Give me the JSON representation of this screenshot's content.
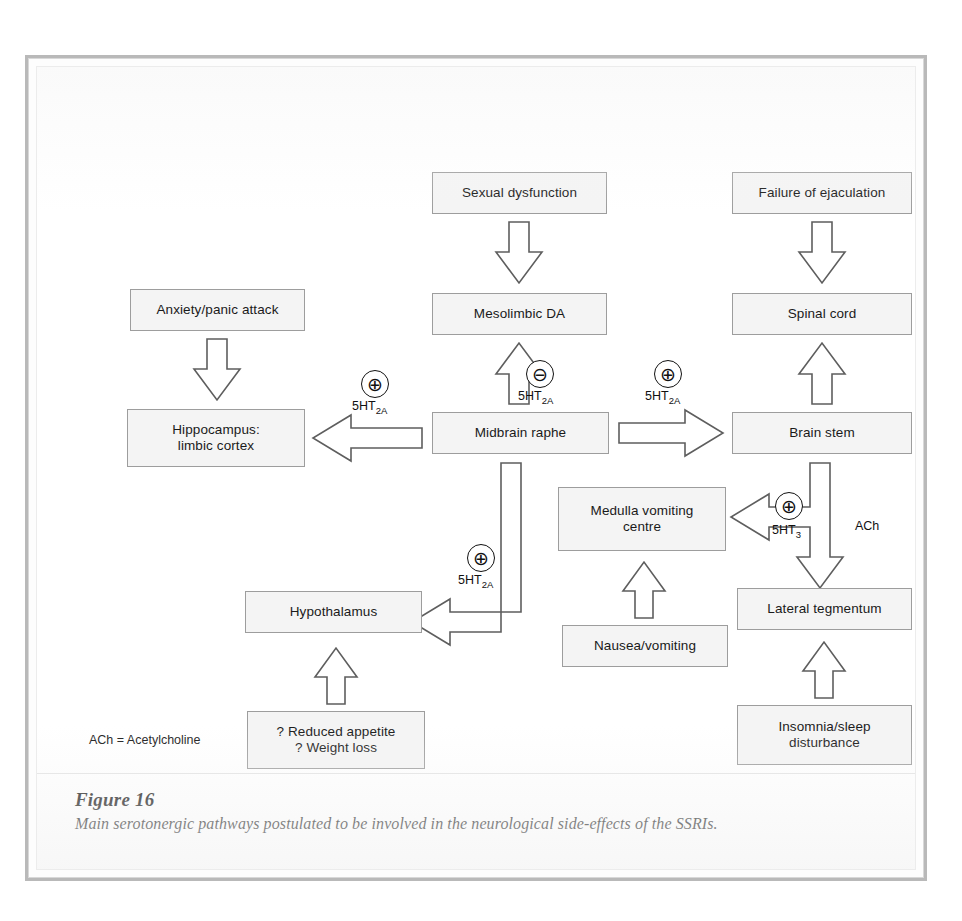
{
  "figure": {
    "number": "Figure 16",
    "caption": "Main serotonergic pathways postulated to be involved in the neurological side-effects of the SSRIs.",
    "legend": "ACh = Acetylcholine"
  },
  "diagram": {
    "type": "flowchart",
    "nodes": [
      {
        "id": "sexual-dysfunction",
        "label": "Sexual dysfunction",
        "x": 395,
        "y": 105,
        "w": 175,
        "h": 42
      },
      {
        "id": "failure-ejaculation",
        "label": "Failure of ejaculation",
        "x": 695,
        "y": 105,
        "w": 180,
        "h": 42
      },
      {
        "id": "anxiety-panic",
        "label": "Anxiety/panic attack",
        "x": 93,
        "y": 222,
        "w": 175,
        "h": 42
      },
      {
        "id": "mesolimbic-da",
        "label": "Mesolimbic DA",
        "x": 395,
        "y": 226,
        "w": 175,
        "h": 42
      },
      {
        "id": "spinal-cord",
        "label": "Spinal cord",
        "x": 695,
        "y": 226,
        "w": 180,
        "h": 42
      },
      {
        "id": "hippocampus",
        "label": "Hippocampus:\nlimbic cortex",
        "x": 90,
        "y": 342,
        "w": 178,
        "h": 58
      },
      {
        "id": "midbrain-raphe",
        "label": "Midbrain raphe",
        "x": 395,
        "y": 345,
        "w": 177,
        "h": 42
      },
      {
        "id": "brain-stem",
        "label": "Brain stem",
        "x": 695,
        "y": 345,
        "w": 180,
        "h": 42
      },
      {
        "id": "medulla-vomiting",
        "label": "Medulla vomiting\ncentre",
        "x": 521,
        "y": 420,
        "w": 168,
        "h": 64
      },
      {
        "id": "lateral-tegmentum",
        "label": "Lateral tegmentum",
        "x": 700,
        "y": 521,
        "w": 175,
        "h": 42
      },
      {
        "id": "hypothalamus",
        "label": "Hypothalamus",
        "x": 208,
        "y": 524,
        "w": 177,
        "h": 42
      },
      {
        "id": "nausea-vomiting",
        "label": "Nausea/vomiting",
        "x": 525,
        "y": 558,
        "w": 166,
        "h": 42
      },
      {
        "id": "reduced-appetite",
        "label": "? Reduced appetite\n? Weight loss",
        "x": 210,
        "y": 644,
        "w": 178,
        "h": 58
      },
      {
        "id": "insomnia-sleep",
        "label": "Insomnia/sleep\ndisturbance",
        "x": 700,
        "y": 638,
        "w": 175,
        "h": 60
      }
    ],
    "edges": [
      {
        "id": "e-sexdys-mesolimbic",
        "from": "sexual-dysfunction",
        "to": "mesolimbic-da",
        "direction": "down",
        "sign": "",
        "receptor": ""
      },
      {
        "id": "e-failej-spinal",
        "from": "failure-ejaculation",
        "to": "spinal-cord",
        "direction": "down",
        "sign": "",
        "receptor": ""
      },
      {
        "id": "e-anxiety-hippocampus",
        "from": "anxiety-panic",
        "to": "hippocampus",
        "direction": "down",
        "sign": "",
        "receptor": ""
      },
      {
        "id": "e-raphe-hippocampus",
        "from": "midbrain-raphe",
        "to": "hippocampus",
        "direction": "left",
        "sign": "plus",
        "receptor": "5HT2A"
      },
      {
        "id": "e-raphe-mesolimbic",
        "from": "midbrain-raphe",
        "to": "mesolimbic-da",
        "direction": "up",
        "sign": "minus",
        "receptor": "5HT2A"
      },
      {
        "id": "e-raphe-brainstem",
        "from": "midbrain-raphe",
        "to": "brain-stem",
        "direction": "right",
        "sign": "plus",
        "receptor": "5HT2A"
      },
      {
        "id": "e-brainstem-spinal",
        "from": "brain-stem",
        "to": "spinal-cord",
        "direction": "up",
        "sign": "",
        "receptor": ""
      },
      {
        "id": "e-brainstem-medulla",
        "from": "brain-stem",
        "to": "medulla-vomiting",
        "direction": "left",
        "sign": "plus",
        "receptor": "5HT3"
      },
      {
        "id": "e-brainstem-tegmentum",
        "from": "brain-stem",
        "to": "lateral-tegmentum",
        "direction": "down",
        "sign": "",
        "receptor": "ACh"
      },
      {
        "id": "e-raphe-hypothalamus",
        "from": "midbrain-raphe",
        "to": "hypothalamus",
        "direction": "left",
        "sign": "plus",
        "receptor": "5HT2A"
      },
      {
        "id": "e-nausea-medulla",
        "from": "nausea-vomiting",
        "to": "medulla-vomiting",
        "direction": "up",
        "sign": "",
        "receptor": ""
      },
      {
        "id": "e-appetite-hypothal",
        "from": "reduced-appetite",
        "to": "hypothalamus",
        "direction": "up",
        "sign": "",
        "receptor": ""
      },
      {
        "id": "e-insomnia-tegmentum",
        "from": "insomnia-sleep",
        "to": "lateral-tegmentum",
        "direction": "up",
        "sign": "",
        "receptor": ""
      }
    ],
    "badges": [
      {
        "id": "badge-raphe-hippocampus",
        "sign": "⊕",
        "name": "plus-sign-icon",
        "x": 324,
        "y": 303
      },
      {
        "id": "badge-raphe-mesolimbic",
        "sign": "⊖",
        "name": "minus-sign-icon",
        "x": 489,
        "y": 293
      },
      {
        "id": "badge-raphe-brainstem",
        "sign": "⊕",
        "name": "plus-sign-icon",
        "x": 617,
        "y": 293
      },
      {
        "id": "badge-brainstem-medulla",
        "sign": "⊕",
        "name": "plus-sign-icon",
        "x": 738,
        "y": 425
      },
      {
        "id": "badge-raphe-hypothalamus",
        "sign": "⊕",
        "name": "plus-sign-icon",
        "x": 430,
        "y": 477
      }
    ],
    "receptor_labels": [
      {
        "id": "lbl-raphe-hippocampus",
        "base": "5HT",
        "sub": "2A",
        "x": 315,
        "y": 332
      },
      {
        "id": "lbl-raphe-mesolimbic",
        "base": "5HT",
        "sub": "2A",
        "x": 481,
        "y": 322
      },
      {
        "id": "lbl-raphe-brainstem",
        "base": "5HT",
        "sub": "2A",
        "x": 608,
        "y": 322
      },
      {
        "id": "lbl-brainstem-medulla",
        "base": "5HT",
        "sub": "3",
        "x": 735,
        "y": 456
      },
      {
        "id": "lbl-brainstem-ach",
        "base": "ACh",
        "sub": "",
        "x": 818,
        "y": 452
      },
      {
        "id": "lbl-raphe-hypothalamus",
        "base": "5HT",
        "sub": "2A",
        "x": 421,
        "y": 506
      }
    ]
  }
}
